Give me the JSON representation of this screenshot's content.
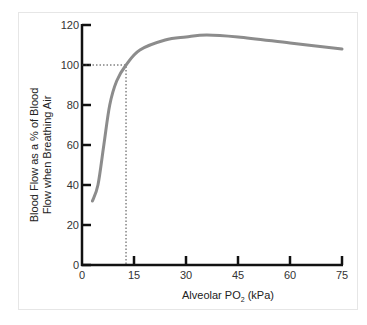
{
  "chart_data": {
    "type": "line",
    "title": "",
    "xlabel": "Alveolar PO2 (kPa)",
    "xlabel_parts": {
      "main": "Alveolar PO",
      "sub": "2",
      "unit": " (kPa)"
    },
    "ylabel": "Blood Flow as a % of Blood Flow when Breathing Air",
    "ylabel_lines": [
      "Blood Flow as a % of Blood",
      "Flow when Breathing Air"
    ],
    "xlim": [
      0,
      75
    ],
    "ylim": [
      0,
      120
    ],
    "x_ticks": [
      0,
      15,
      30,
      45,
      60,
      75
    ],
    "y_ticks": [
      0,
      20,
      40,
      60,
      80,
      100,
      120
    ],
    "grid": false,
    "series": [
      {
        "name": "Blood flow",
        "color": "#8c8c8c",
        "x": [
          3,
          4.6,
          6.3,
          8,
          10,
          12.7,
          16.7,
          24,
          30,
          36,
          45,
          60,
          75
        ],
        "y": [
          32,
          40,
          60,
          80,
          92,
          100,
          107.5,
          112.5,
          114,
          115,
          114,
          111,
          108
        ]
      }
    ],
    "annotations": [
      {
        "type": "dotted-guide",
        "x": 12.7,
        "y": 100,
        "description": "Dotted lines marking 100% blood flow at ~13 kPa (air breathing)"
      }
    ]
  }
}
